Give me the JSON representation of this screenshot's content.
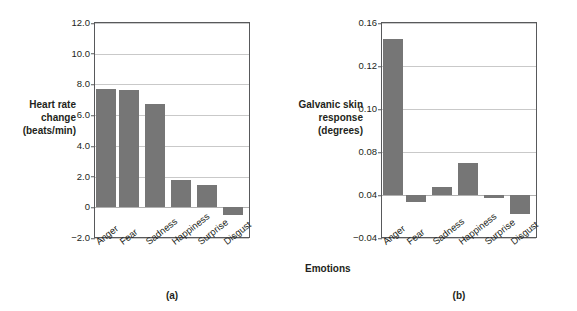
{
  "figure": {
    "background": "#ffffff",
    "bar_color": "#767676",
    "frame_color": "#58595b",
    "grid_color": "#c9c9c9"
  },
  "chart_data": [
    {
      "type": "bar",
      "panel": "(a)",
      "title": "",
      "xlabel": "",
      "ylabel": "Heart rate\nchange\n(beats/min)",
      "categories": [
        "Anger",
        "Fear",
        "Sadness",
        "Happiness",
        "Surprise",
        "Disgust"
      ],
      "values": [
        7.7,
        7.65,
        6.7,
        1.8,
        1.45,
        -0.5
      ],
      "yticks": [
        12.0,
        10.0,
        8.0,
        6.0,
        4.0,
        2.0,
        0,
        -2.0
      ],
      "ytick_labels": [
        "12.0",
        "10.0",
        "8.0",
        "6.0",
        "4.0",
        "2.0",
        "0",
        "−2.0"
      ],
      "ylim": [
        -2.0,
        12.0
      ],
      "baseline": 0,
      "grid": true,
      "legend": "none"
    },
    {
      "type": "bar",
      "panel": "(b)",
      "title": "",
      "xlabel": "Emotions",
      "ylabel": "Galvanic skin\nresponse\n(degrees)",
      "categories": [
        "Anger",
        "Fear",
        "Sadness",
        "Happiness",
        "Surprise",
        "Disgust"
      ],
      "values": [
        0.145,
        0.027,
        0.047,
        0.07,
        0.034,
        0.005
      ],
      "yticks": [
        0.16,
        0.12,
        0.1,
        0.08,
        0.04,
        -0.04
      ],
      "ytick_labels": [
        "0.16",
        "0.12",
        "0.10",
        "0.08",
        "0.04",
        "−0.04"
      ],
      "ylim": [
        -0.04,
        0.16
      ],
      "baseline": 0.04,
      "grid": true,
      "legend": "none",
      "note": "tick labels are drawn at evenly spaced slots as printed in the source figure"
    }
  ],
  "panel_a": {
    "caption": "(a)",
    "ylabel": "Heart rate\nchange\n(beats/min)",
    "ytick_labels": [
      "12.0",
      "10.0",
      "8.0",
      "6.0",
      "4.0",
      "2.0",
      "0",
      "−2.0"
    ],
    "categories": [
      "Anger",
      "Fear",
      "Sadness",
      "Happiness",
      "Surprise",
      "Disgust"
    ]
  },
  "panel_b": {
    "caption": "(b)",
    "ylabel": "Galvanic skin\nresponse\n(degrees)",
    "xlabel": "Emotions",
    "ytick_labels": [
      "0.16",
      "0.12",
      "0.10",
      "0.08",
      "0.04",
      "−0.04"
    ],
    "categories": [
      "Anger",
      "Fear",
      "Sadness",
      "Happiness",
      "Surprise",
      "Disgust"
    ]
  }
}
